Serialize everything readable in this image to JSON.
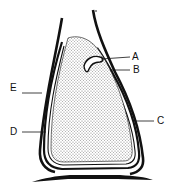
{
  "diagram": {
    "type": "biological-structure-cross-section",
    "labels": [
      {
        "id": "A",
        "text": "A",
        "x": 132,
        "y": 60
      },
      {
        "id": "B",
        "text": "B",
        "x": 133,
        "y": 73
      },
      {
        "id": "C",
        "text": "C",
        "x": 157,
        "y": 124
      },
      {
        "id": "D",
        "text": "D",
        "x": 10,
        "y": 135
      },
      {
        "id": "E",
        "text": "E",
        "x": 10,
        "y": 91
      }
    ],
    "colors": {
      "outline": "#111111",
      "stipple": "#8a8a8a",
      "background": "#ffffff"
    }
  }
}
